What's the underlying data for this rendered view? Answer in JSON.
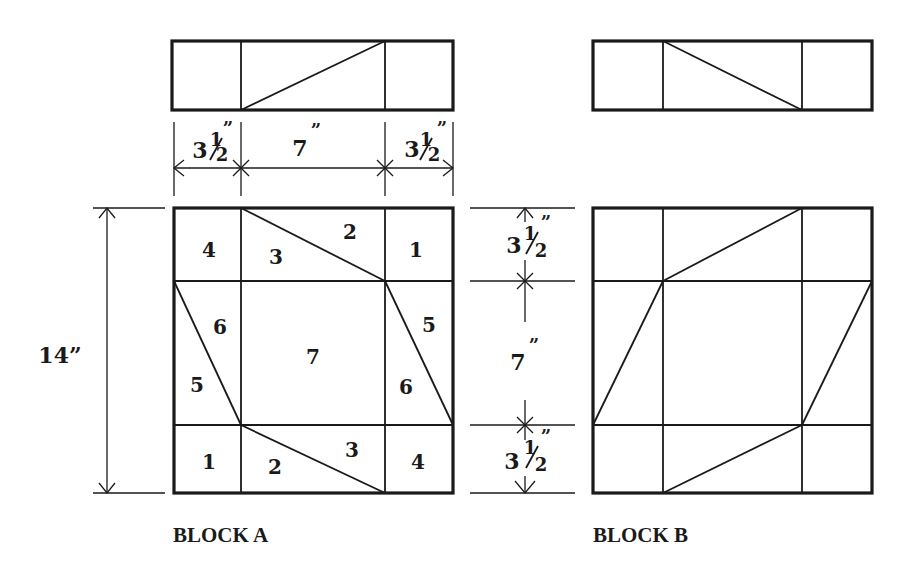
{
  "colors": {
    "ink": "#1a1a1a",
    "paper": "#ffffff"
  },
  "block_a": {
    "caption": "BLOCK A",
    "grid": {
      "x": [
        174,
        241,
        385,
        453
      ],
      "y": [
        208,
        281,
        425,
        493
      ]
    },
    "diagonals": [
      [
        241,
        208,
        385,
        281
      ],
      [
        385,
        281,
        453,
        425
      ],
      [
        174,
        281,
        241,
        425
      ],
      [
        241,
        425,
        385,
        493
      ]
    ],
    "pieces": [
      {
        "label": "4",
        "x": 209,
        "y": 250
      },
      {
        "label": "3",
        "x": 276,
        "y": 257
      },
      {
        "label": "2",
        "x": 350,
        "y": 232
      },
      {
        "label": "1",
        "x": 416,
        "y": 250
      },
      {
        "label": "6",
        "x": 220,
        "y": 327
      },
      {
        "label": "5",
        "x": 197,
        "y": 385
      },
      {
        "label": "7",
        "x": 313,
        "y": 357
      },
      {
        "label": "5",
        "x": 429,
        "y": 325
      },
      {
        "label": "6",
        "x": 406,
        "y": 387
      },
      {
        "label": "1",
        "x": 209,
        "y": 462
      },
      {
        "label": "2",
        "x": 275,
        "y": 467
      },
      {
        "label": "3",
        "x": 352,
        "y": 450
      },
      {
        "label": "4",
        "x": 418,
        "y": 462
      }
    ]
  },
  "block_b": {
    "caption": "BLOCK B",
    "grid": {
      "x": [
        593,
        663,
        802,
        872
      ],
      "y": [
        208,
        281,
        425,
        493
      ]
    },
    "diagonals": [
      [
        663,
        281,
        802,
        208
      ],
      [
        802,
        425,
        872,
        281
      ],
      [
        593,
        425,
        663,
        281
      ],
      [
        663,
        493,
        802,
        425
      ]
    ]
  },
  "strip_a": {
    "grid": {
      "x": [
        172,
        241,
        385,
        453
      ],
      "y": [
        41,
        110
      ]
    },
    "diagonal": [
      241,
      110,
      385,
      41
    ]
  },
  "strip_b": {
    "grid": {
      "x": [
        593,
        663,
        802,
        872
      ],
      "y": [
        41,
        110
      ]
    },
    "diagonal": [
      663,
      41,
      802,
      110
    ]
  },
  "dimensions": {
    "horizontal": {
      "line_y": 168,
      "segments": [
        {
          "whole": "3",
          "frac_num": "1",
          "frac_den": "2",
          "unit": "”",
          "label": "3½”",
          "x1": 174,
          "x2": 241
        },
        {
          "whole": "7",
          "unit": "”",
          "label": "7”",
          "x1": 241,
          "x2": 385
        },
        {
          "whole": "3",
          "frac_num": "1",
          "frac_den": "2",
          "unit": "”",
          "label": "3½”",
          "x1": 385,
          "x2": 453
        }
      ]
    },
    "left_total": {
      "label": "14”",
      "line_x": 107,
      "y1": 208,
      "y2": 493
    },
    "right_vertical": {
      "line_x": 525,
      "segments": [
        {
          "whole": "3",
          "frac_num": "1",
          "frac_den": "2",
          "unit": "”",
          "label": "3½”",
          "y1": 208,
          "y2": 281
        },
        {
          "whole": "7",
          "unit": "”",
          "label": "7”",
          "y1": 281,
          "y2": 425
        },
        {
          "whole": "3",
          "frac_num": "1",
          "frac_den": "2",
          "unit": "”",
          "label": "3½”",
          "y1": 425,
          "y2": 493
        }
      ]
    }
  }
}
